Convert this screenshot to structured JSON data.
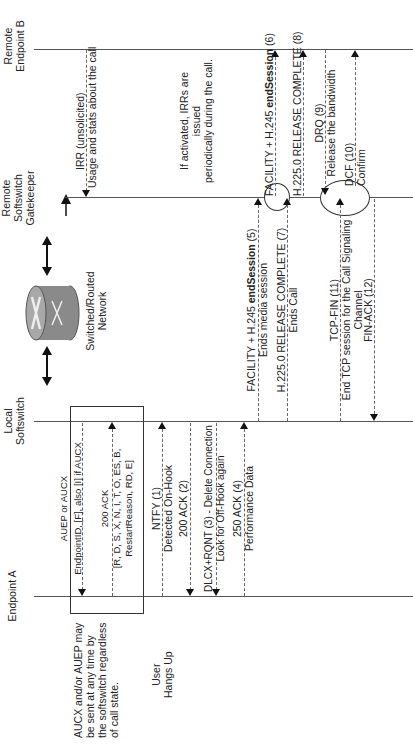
{
  "participants": {
    "endpoint_a": "Endpoint A",
    "local_softswitch": [
      "Local",
      "Softswitch"
    ],
    "network": [
      "Switched/Routed",
      "Network"
    ],
    "gatekeeper": [
      "Remote",
      "Softswitch",
      "Gatekeeper"
    ],
    "endpoint_b": [
      "Remote",
      "Endpoint B"
    ]
  },
  "notes": {
    "audit": [
      "AUCX and/or AUEP may",
      "be sent at any time by",
      "the softswitch regardless",
      "of call state."
    ],
    "user_hangs_up": [
      "User",
      "Hangs Up"
    ],
    "irr_periodic": [
      "If activated, IRRs are issued",
      "periodically during the call."
    ]
  },
  "messages": {
    "auep": [
      "AUEP or AUCX",
      "EndpointID, [F], also [I] if AUCX"
    ],
    "ack200": [
      "200 ACK",
      "[R, D, S, X, N, I, T, O, ES, B,",
      "RestartReason, RD, E]"
    ],
    "ntfy": [
      "NTFY (1)",
      "Detected On-Hook"
    ],
    "ack2": [
      "200 ACK (2)"
    ],
    "dlcx": [
      "DLCX+RQNT (3) - Delete Connection",
      "Look for Off-Hook again"
    ],
    "ack4": [
      "250 ACK (4)",
      "Performance Data"
    ],
    "facility5": [
      "FACILITY + H.245 ",
      "endSession",
      " (5)",
      "Ends media session"
    ],
    "rc7": [
      "H.225.0 RELEASE COMPLETE (7)",
      "Ends Call"
    ],
    "tcpfin": [
      "TCP-FIN (11)",
      "End TCP session for the Call Signaling",
      "Channel"
    ],
    "finack": [
      "FIN-ACK (12)"
    ],
    "irr": [
      "IRR (unsolicited)",
      "Usage and stats about the call"
    ],
    "facility6": [
      "FACILITY + H.245 ",
      "endSession",
      " (6)"
    ],
    "rc8": [
      "H.225.0 RELEASE COMPLETE (8)"
    ],
    "drq": [
      "DRQ (9)",
      "Release the bandwidth"
    ],
    "dcf": [
      "DCF (10)",
      "Confirm"
    ]
  }
}
